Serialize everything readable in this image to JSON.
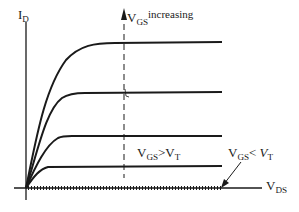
{
  "diagram": {
    "type": "MOSFET output characteristics (I_D vs V_DS)",
    "y_axis": {
      "main": "I",
      "sub": "D"
    },
    "x_axis": {
      "main": "V",
      "sub": "DS"
    },
    "annotations": {
      "increasing": {
        "main": "V",
        "sub": "GS",
        "suffix": "increasing"
      },
      "above_threshold": {
        "main": "V",
        "sub": "GS",
        "op": ">",
        "rhs_main": "V",
        "rhs_sub": "T"
      },
      "below_threshold": {
        "main": "V",
        "sub": "GS",
        "op": "<",
        "rhs_main": "V",
        "rhs_sub": "T"
      }
    },
    "curves": [
      {
        "name": "highest-vgs",
        "plateau_y": 43
      },
      {
        "name": "curve-2",
        "plateau_y": 93
      },
      {
        "name": "curve-3",
        "plateau_y": 137
      },
      {
        "name": "lowest-vgs-above-vt",
        "plateau_y": 167
      }
    ],
    "colors": {
      "ink": "#1a1a1a",
      "background": "#ffffff"
    }
  }
}
